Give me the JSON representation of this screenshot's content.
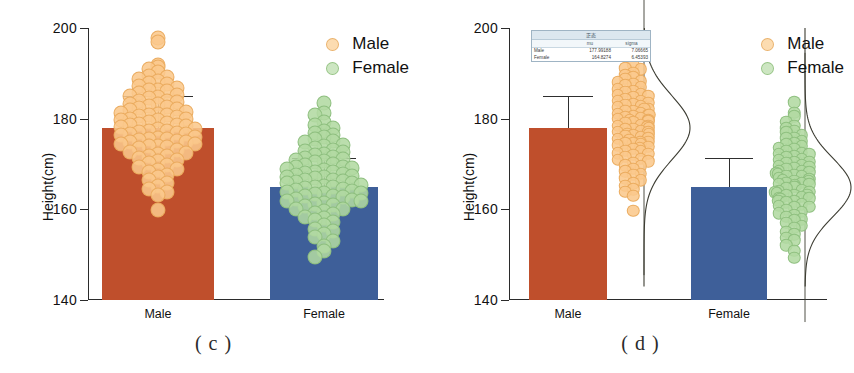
{
  "figure": {
    "panels": [
      {
        "id": "c",
        "caption": "( c )",
        "type": "bar-with-dots"
      },
      {
        "id": "d",
        "caption": "( d )",
        "type": "bar-with-violin-dots"
      }
    ]
  },
  "axes": {
    "ylabel": "Height(cm)",
    "yticks": [
      140,
      160,
      180,
      200
    ],
    "ytick_labels": [
      "140",
      "160",
      "180",
      "200"
    ],
    "ylim": [
      140,
      200
    ],
    "xticks": [
      "Male",
      "Female"
    ]
  },
  "legend": {
    "position": "top-right",
    "entries": [
      {
        "label": "Male",
        "marker": "circle-open",
        "color": "#f3c98b"
      },
      {
        "label": "Female",
        "marker": "circle-open",
        "color": "#a8d29a"
      }
    ]
  },
  "colors": {
    "male_bar": "#bf4f2c",
    "female_bar": "#3e5f99",
    "male_dot": "#f7cc95",
    "female_dot": "#b2d9a2",
    "error_bar": "#2e2e2e",
    "density_curve": "#3c3c32",
    "axis": "#2b2b2b",
    "table_header_bg": "#dce7ef"
  },
  "stats_table": {
    "title": "正态",
    "columns": [
      "",
      "mu",
      "sigma"
    ],
    "rows": [
      {
        "group": "Male",
        "mu": "177.99188",
        "sigma": "7.06665"
      },
      {
        "group": "Female",
        "mu": "164.8274",
        "sigma": "6.45393"
      }
    ]
  },
  "chart_data": {
    "type": "bar",
    "title": "",
    "subtitle": "",
    "xlabel": "",
    "ylabel": "Height(cm)",
    "ylim": [
      140,
      200
    ],
    "yticks": [
      140,
      160,
      180,
      200
    ],
    "grid": false,
    "legend_position": "top-right",
    "categories": [
      "Male",
      "Female"
    ],
    "series": [
      {
        "name": "Mean height",
        "values": [
          177.99,
          164.83
        ],
        "errors_sd": [
          7.07,
          6.45
        ],
        "error_upper": [
          185.06,
          171.28
        ]
      }
    ],
    "panel_c": {
      "type": "bar",
      "description": "Bar chart of mean height with SD error bars and overlaid jittered dot swarm of individual observations",
      "categories": [
        "Male",
        "Female"
      ],
      "values": [
        177.99,
        164.83
      ],
      "error_upper": [
        185.06,
        171.28
      ],
      "bar_colors": [
        "#bf4f2c",
        "#3e5f99"
      ],
      "dot_colors": [
        "#f7cc95",
        "#b2d9a2"
      ],
      "male_points": [
        197.6,
        196.9,
        192.0,
        191.3,
        190.8,
        190.2,
        189.6,
        189.1,
        188.7,
        188.4,
        188.0,
        187.6,
        187.2,
        186.9,
        186.5,
        186.2,
        185.9,
        185.6,
        185.3,
        185.0,
        184.7,
        184.4,
        184.1,
        183.9,
        183.6,
        183.3,
        183.1,
        182.8,
        182.6,
        182.3,
        182.1,
        181.8,
        181.6,
        181.4,
        181.1,
        180.9,
        180.7,
        180.5,
        180.3,
        180.1,
        179.9,
        179.7,
        179.5,
        179.3,
        179.1,
        178.9,
        178.7,
        178.5,
        178.3,
        178.1,
        177.9,
        177.7,
        177.5,
        177.3,
        177.1,
        176.9,
        176.7,
        176.5,
        176.3,
        176.1,
        175.9,
        175.7,
        175.5,
        175.3,
        175.1,
        174.9,
        174.7,
        174.5,
        174.3,
        174.1,
        173.9,
        173.7,
        173.4,
        173.1,
        172.8,
        172.5,
        172.2,
        171.9,
        171.6,
        171.3,
        171.0,
        170.6,
        170.2,
        169.8,
        169.4,
        169.0,
        168.5,
        168.0,
        167.5,
        167.0,
        166.4,
        165.8,
        165.2,
        164.5,
        163.8,
        163.0,
        159.8
      ],
      "female_points": [
        183.5,
        181.2,
        180.6,
        179.4,
        178.6,
        178.0,
        177.4,
        176.9,
        176.4,
        175.9,
        175.5,
        175.1,
        174.7,
        174.3,
        173.9,
        173.6,
        173.2,
        172.9,
        172.6,
        172.3,
        172.0,
        171.7,
        171.4,
        171.1,
        170.9,
        170.6,
        170.3,
        170.1,
        169.8,
        169.6,
        169.3,
        169.1,
        168.9,
        168.6,
        168.4,
        168.2,
        168.0,
        167.8,
        167.6,
        167.4,
        167.2,
        167.0,
        166.8,
        166.6,
        166.4,
        166.2,
        166.0,
        165.8,
        165.6,
        165.4,
        165.2,
        165.0,
        164.8,
        164.6,
        164.4,
        164.2,
        164.0,
        163.8,
        163.6,
        163.4,
        163.2,
        163.0,
        162.8,
        162.6,
        162.4,
        162.2,
        162.0,
        161.8,
        161.5,
        161.2,
        160.9,
        160.6,
        160.3,
        160.0,
        159.6,
        159.2,
        158.8,
        158.4,
        158.0,
        157.5,
        157.0,
        156.4,
        155.8,
        155.2,
        154.5,
        153.8,
        153.0,
        152.0,
        150.8,
        149.4
      ]
    },
    "panel_d": {
      "type": "bar",
      "description": "Bar chart of mean height with SD error bars, separated dot swarm and fitted normal density curve per group",
      "categories": [
        "Male",
        "Female"
      ],
      "values": [
        177.99,
        164.83
      ],
      "error_upper": [
        185.06,
        171.28
      ],
      "bar_colors": [
        "#bf4f2c",
        "#3e5f99"
      ],
      "dot_colors": [
        "#f7cc95",
        "#b2d9a2"
      ],
      "normal_fit": [
        {
          "group": "Male",
          "mu": 177.99188,
          "sigma": 7.06665
        },
        {
          "group": "Female",
          "mu": 164.8274,
          "sigma": 6.45393
        }
      ]
    }
  }
}
